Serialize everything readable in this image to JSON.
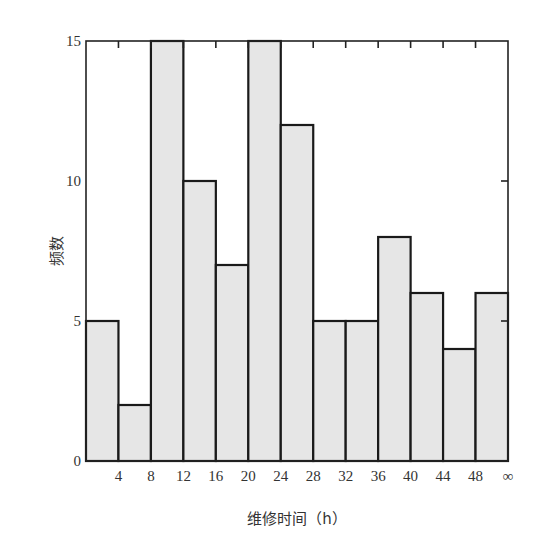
{
  "chart_data": {
    "type": "bar",
    "title": "",
    "xlabel": "维修时间（h）",
    "ylabel": "频数",
    "bin_edges_labels": [
      "4",
      "8",
      "12",
      "16",
      "20",
      "24",
      "28",
      "32",
      "36",
      "40",
      "44",
      "48",
      "∞"
    ],
    "categories": [
      "0-4",
      "4-8",
      "8-12",
      "12-16",
      "16-20",
      "20-24",
      "24-28",
      "28-32",
      "32-36",
      "36-40",
      "40-44",
      "44-48",
      "48-∞"
    ],
    "values": [
      5,
      2,
      15,
      10,
      7,
      15,
      12,
      5,
      5,
      8,
      6,
      4,
      6
    ],
    "yticks": [
      0,
      5,
      10,
      15
    ],
    "ylim": [
      0,
      15
    ],
    "grid": false,
    "legend": "none"
  }
}
